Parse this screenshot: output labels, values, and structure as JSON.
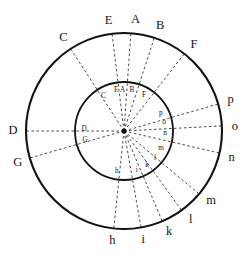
{
  "figure": {
    "geometry": {
      "center_x": 124,
      "center_y": 131,
      "outer_radius": 98,
      "inner_radius": 49,
      "center_dot_radius": 2.6
    },
    "style": {
      "stroke_color": "#111111",
      "ray_color": "#2a2a2a",
      "background": "#ffffff",
      "outer_stroke_width": 2.1,
      "inner_stroke_width": 1.8,
      "ray_dash": "2.6 2.4"
    }
  },
  "rays": [
    {
      "id": "ray-C",
      "label": "C",
      "inner_label": "C",
      "outer_label": "C",
      "angle_deg": 123,
      "outer_label_angle_deg": 123,
      "inner_label_angle_deg": 121,
      "outer_label_offset": 13,
      "inner_label_offset": -9
    },
    {
      "id": "ray-E",
      "label": "E",
      "inner_label": "E",
      "outer_label": "E",
      "angle_deg": 97,
      "outer_label_angle_deg": 98,
      "inner_label_angle_deg": 101,
      "outer_label_offset": 13,
      "inner_label_offset": -8
    },
    {
      "id": "ray-A",
      "label": "A",
      "inner_label": "A",
      "outer_label": "A",
      "angle_deg": 86,
      "outer_label_angle_deg": 84,
      "inner_label_angle_deg": 92,
      "outer_label_offset": 13,
      "inner_label_offset": -8
    },
    {
      "id": "ray-B",
      "label": "B",
      "inner_label": "B",
      "outer_label": "B",
      "angle_deg": 72,
      "outer_label_angle_deg": 71,
      "inner_label_angle_deg": 79,
      "outer_label_offset": 13,
      "inner_label_offset": -8
    },
    {
      "id": "ray-F",
      "label": "F",
      "inner_label": "F",
      "outer_label": "F",
      "angle_deg": 52,
      "outer_label_angle_deg": 51,
      "inner_label_angle_deg": 61,
      "outer_label_offset": 13,
      "inner_label_offset": -8
    },
    {
      "id": "ray-p",
      "label": "p",
      "inner_label": "p",
      "outer_label": "p",
      "angle_deg": 16,
      "outer_label_angle_deg": 16,
      "inner_label_angle_deg": 26,
      "outer_label_offset": 13,
      "inner_label_offset": -8
    },
    {
      "id": "ray-o",
      "label": "o",
      "inner_label": "o",
      "outer_label": "o",
      "angle_deg": 3,
      "outer_label_angle_deg": 2,
      "inner_label_angle_deg": 12,
      "outer_label_offset": 13,
      "inner_label_offset": -8
    },
    {
      "id": "ray-n",
      "label": "n",
      "inner_label": "n",
      "outer_label": "n",
      "angle_deg": -13,
      "outer_label_angle_deg": -14,
      "inner_label_angle_deg": -3,
      "outer_label_offset": 13,
      "inner_label_offset": -8
    },
    {
      "id": "ray-m",
      "label": "m",
      "inner_label": "m",
      "outer_label": "m",
      "angle_deg": -40,
      "outer_label_angle_deg": -39,
      "inner_label_angle_deg": -25,
      "outer_label_offset": 14,
      "inner_label_offset": -8
    },
    {
      "id": "ray-l",
      "label": "l",
      "inner_label": "l",
      "outer_label": "l",
      "angle_deg": -54,
      "outer_label_angle_deg": -53,
      "inner_label_angle_deg": -41,
      "outer_label_offset": 13,
      "inner_label_offset": -8
    },
    {
      "id": "ray-k",
      "label": "k",
      "inner_label": "k",
      "outer_label": "k",
      "angle_deg": -67,
      "outer_label_angle_deg": -66,
      "inner_label_angle_deg": -56,
      "outer_label_offset": 13,
      "inner_label_offset": -8
    },
    {
      "id": "ray-i",
      "label": "i",
      "inner_label": "i",
      "outer_label": "i",
      "angle_deg": -80,
      "outer_label_angle_deg": -80,
      "inner_label_angle_deg": -72,
      "outer_label_offset": 13,
      "inner_label_offset": -8
    },
    {
      "id": "ray-h",
      "label": "h",
      "inner_label": "h",
      "outer_label": "h",
      "angle_deg": -96,
      "outer_label_angle_deg": -96,
      "inner_label_angle_deg": -100,
      "outer_label_offset": 13,
      "inner_label_offset": -8
    },
    {
      "id": "ray-G",
      "label": "G",
      "inner_label": "G",
      "outer_label": "G",
      "angle_deg": 196,
      "outer_label_angle_deg": 197,
      "inner_label_angle_deg": 193,
      "outer_label_offset": 13,
      "inner_label_offset": -9
    },
    {
      "id": "ray-D",
      "label": "D",
      "inner_label": "D",
      "outer_label": "D",
      "angle_deg": 180,
      "outer_label_angle_deg": 180,
      "inner_label_angle_deg": 177,
      "outer_label_offset": 13,
      "inner_label_offset": -9
    }
  ],
  "outer_labels": [
    "C",
    "E",
    "A",
    "B",
    "F",
    "p",
    "o",
    "n",
    "m",
    "l",
    "k",
    "i",
    "h",
    "G",
    "D"
  ],
  "inner_labels": [
    "C",
    "E",
    "A",
    "B",
    "F",
    "p",
    "o",
    "n",
    "m",
    "l",
    "k",
    "i",
    "h",
    "G",
    "D"
  ]
}
